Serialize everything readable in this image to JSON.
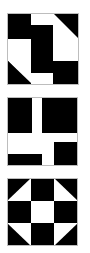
{
  "colors": {
    "fill": "#000000",
    "background": "#ffffff",
    "border": "#bdbdbd"
  },
  "tiles": [
    {
      "name": "block-pattern-1",
      "pattern": "interlocking-block",
      "index": 1
    },
    {
      "name": "block-pattern-2",
      "pattern": "cross-block",
      "index": 2
    },
    {
      "name": "block-pattern-3",
      "pattern": "shoo-fly-block",
      "index": 3
    }
  ]
}
